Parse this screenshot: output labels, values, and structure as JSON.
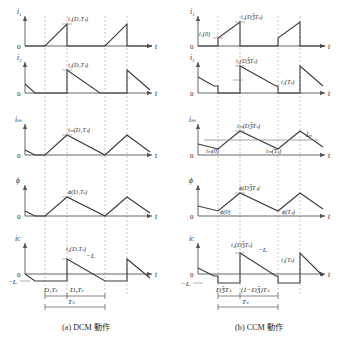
{
  "figure": {
    "title": "",
    "panels": [
      {
        "id": "dcm",
        "caption": "(a) DCM 動作",
        "mode": "DCM",
        "timing": {
          "seg1": "D₁Tₛ",
          "seg2": "D₃Tₛ",
          "period": "Tₛ"
        },
        "plots": [
          {
            "name": "i1",
            "yaxis": "i₁",
            "xaxis": "t",
            "zero": "0",
            "peak_label": "i₁(D₁Tₛ)",
            "init_label": "",
            "end_label": "",
            "avg_label": "",
            "neg_label": ""
          },
          {
            "name": "i2",
            "yaxis": "i₂",
            "xaxis": "t",
            "zero": "0",
            "peak_label": "i₂(D₁Tₛ)",
            "init_label": "",
            "end_label": "",
            "avg_label": "",
            "neg_label": ""
          },
          {
            "name": "im",
            "yaxis": "iₘ",
            "xaxis": "t",
            "zero": "0",
            "peak_label": "iₘ(D₁Tₛ)",
            "init_label": "",
            "end_label": "",
            "avg_label": "",
            "neg_label": ""
          },
          {
            "name": "phi",
            "yaxis": "ϕ",
            "xaxis": "t",
            "zero": "0",
            "peak_label": "ϕ(D₁Tₛ)",
            "init_label": "",
            "end_label": "",
            "avg_label": "",
            "neg_label": ""
          },
          {
            "name": "iC",
            "yaxis": "iᴄ",
            "xaxis": "t",
            "zero": "0",
            "peak_label": "i₂(D₁Tₛ)",
            "init_label": "",
            "end_label": "",
            "avg_label": "−Iₒ",
            "neg_label": "−Iₒ"
          }
        ]
      },
      {
        "id": "ccm",
        "caption": "(b) CCM 動作",
        "mode": "CCM",
        "timing": {
          "seg1": "DǮTₛ",
          "seg2": "(1−DǮ)Tₛ",
          "period": "Tₛ"
        },
        "plots": [
          {
            "name": "i1",
            "yaxis": "i₁",
            "xaxis": "t",
            "zero": "0",
            "peak_label": "i₁(DǮTₛ)",
            "init_label": "i₁(0)",
            "end_label": "",
            "avg_label": "",
            "neg_label": ""
          },
          {
            "name": "i2",
            "yaxis": "i₂",
            "xaxis": "t",
            "zero": "0",
            "peak_label": "i₂(DǮTₛ)",
            "init_label": "",
            "end_label": "i₂(Tₛ)",
            "avg_label": "",
            "neg_label": ""
          },
          {
            "name": "im",
            "yaxis": "iₘ",
            "xaxis": "t",
            "zero": "0",
            "peak_label": "iₘ(DǮTₛ)",
            "init_label": "iₘ(0)",
            "end_label": "iₘ(Tₛ)",
            "avg_label": "Îₘ",
            "neg_label": ""
          },
          {
            "name": "phi",
            "yaxis": "ϕ",
            "xaxis": "t",
            "zero": "0",
            "peak_label": "ϕ(DǮTₛ)",
            "init_label": "ϕ(0)",
            "end_label": "ϕ(Tₛ)",
            "avg_label": "",
            "neg_label": ""
          },
          {
            "name": "iC",
            "yaxis": "iᴄ",
            "xaxis": "t",
            "zero": "0",
            "peak_label": "i₂(DǮTₛ)",
            "init_label": "",
            "end_label": "i₂(Tₛ)",
            "avg_label": "−Iₒ",
            "neg_label": "−Iₒ"
          }
        ]
      }
    ],
    "colors": {
      "trace": "#3a3a3a",
      "axis": "#555555",
      "dash": "#9a9a9a",
      "text": "#2a2a2a",
      "background": "#ffffff"
    }
  }
}
